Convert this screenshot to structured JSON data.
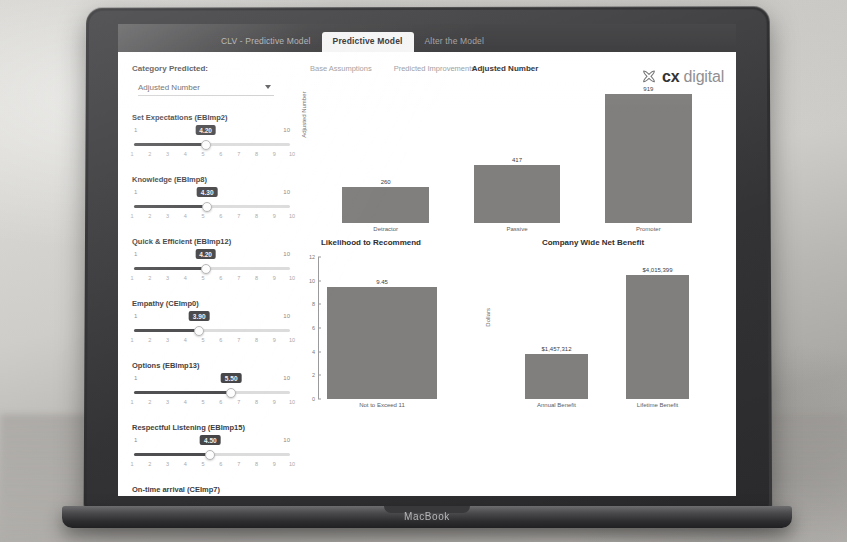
{
  "device": {
    "brand_label": "MacBook"
  },
  "window": {
    "title_tab": "CLV - Predictive Model",
    "tabs": [
      {
        "label": "Predictive Model",
        "active": true
      },
      {
        "label": "Alter the Model",
        "active": false
      }
    ]
  },
  "brand": {
    "mark": "x-flower-icon",
    "name_bold": "cx",
    "name_light": "digital"
  },
  "sidebar": {
    "category_label": "Category Predicted:",
    "category_value": "Adjusted Number",
    "sliders": [
      {
        "name": "Set Expectations",
        "code": "(EBImp2)",
        "value": "4.20",
        "min": "1",
        "max": "10",
        "pct": 46,
        "ticks": [
          "1",
          "2",
          "3",
          "4",
          "5",
          "6",
          "7",
          "8",
          "9",
          "10"
        ]
      },
      {
        "name": "Knowledge",
        "code": "(EBImp8)",
        "value": "4.30",
        "min": "1",
        "max": "10",
        "pct": 47,
        "ticks": [
          "1",
          "2",
          "3",
          "4",
          "5",
          "6",
          "7",
          "8",
          "9",
          "10"
        ]
      },
      {
        "name": "Quick & Efficient",
        "code": "(EBImp12)",
        "value": "4.20",
        "min": "1",
        "max": "10",
        "pct": 46,
        "ticks": [
          "1",
          "2",
          "3",
          "4",
          "5",
          "6",
          "7",
          "8",
          "9",
          "10"
        ]
      },
      {
        "name": "Empathy",
        "code": "(CEImp0)",
        "value": "3.90",
        "min": "1",
        "max": "10",
        "pct": 42,
        "ticks": [
          "1",
          "2",
          "3",
          "4",
          "5",
          "6",
          "7",
          "8",
          "9",
          "10"
        ]
      },
      {
        "name": "Options",
        "code": "(EBImp13)",
        "value": "5.50",
        "min": "1",
        "max": "10",
        "pct": 62,
        "ticks": [
          "1",
          "2",
          "3",
          "4",
          "5",
          "6",
          "7",
          "8",
          "9",
          "10"
        ]
      },
      {
        "name": "Respectful Listening",
        "code": "(EBImp15)",
        "value": "4.50",
        "min": "1",
        "max": "10",
        "pct": 49,
        "ticks": [
          "1",
          "2",
          "3",
          "4",
          "5",
          "6",
          "7",
          "8",
          "9",
          "10"
        ]
      },
      {
        "name": "On-time arrival",
        "code": "(CEImp7)",
        "value": "4.40",
        "min": "1",
        "max": "10",
        "pct": 48,
        "ticks": [
          "1",
          "2",
          "3",
          "4",
          "5",
          "6",
          "7",
          "8",
          "9",
          "10"
        ]
      }
    ]
  },
  "subtabs": [
    {
      "label": "Base Assumptions"
    },
    {
      "label": "Predicted Improvements"
    }
  ],
  "chart_data": [
    {
      "id": "adjusted-number",
      "type": "bar",
      "title": "Adjusted Number",
      "ylabel": "Adjusted Number",
      "xlabel": "",
      "categories": [
        "Detractor",
        "Passive",
        "Promoter"
      ],
      "values": [
        260,
        417,
        919
      ],
      "value_labels": [
        "260",
        "417",
        "919"
      ],
      "ylim": [
        0,
        1000
      ],
      "grid": false,
      "legend": "none"
    },
    {
      "id": "likelihood-to-recommend",
      "type": "bar",
      "title": "Likelihood to Recommend",
      "ylabel": "",
      "xlabel": "",
      "categories": [
        "Not to Exceed 11"
      ],
      "values": [
        9.45
      ],
      "value_labels": [
        "9.45"
      ],
      "ylim": [
        0,
        12
      ],
      "yticks": [
        "12",
        "10",
        "8",
        "6",
        "4",
        "2",
        "0"
      ],
      "grid": false,
      "legend": "none"
    },
    {
      "id": "company-wide-net-benefit",
      "type": "bar",
      "title": "Company Wide Net Benefit",
      "ylabel": "Dollars",
      "xlabel": "",
      "categories": [
        "Annual Benefit",
        "Lifetime Benefit"
      ],
      "values": [
        1457312,
        4015399
      ],
      "value_labels": [
        "$1,457,312",
        "$4,015,399"
      ],
      "ylim": [
        0,
        4600000
      ],
      "grid": false,
      "legend": "none"
    }
  ],
  "colors": {
    "bar": "#807f7d",
    "topbar": "#2f2f31",
    "accent": "#444446"
  }
}
